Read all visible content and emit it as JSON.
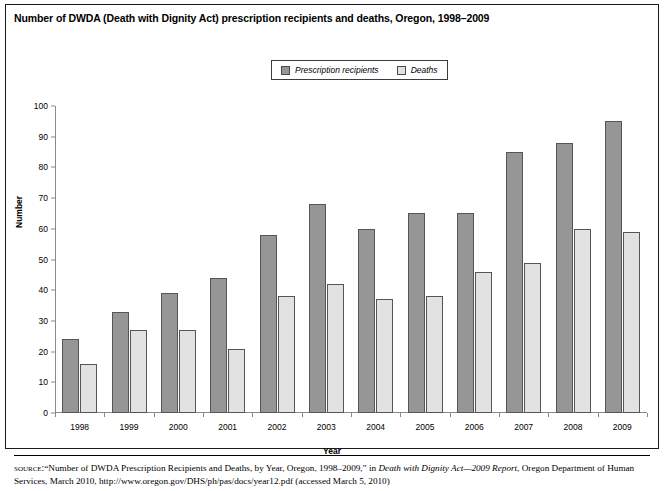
{
  "figure": {
    "title": "Number of DWDA (Death with Dignity Act) prescription recipients and deaths, Oregon, 1998–2009",
    "source_kicker": "source:",
    "source_text_1": "“Number of DWDA Prescription Recipients and Deaths, by Year, Oregon, 1998–2009,” in ",
    "source_italic": "Death with Dignity Act—2009 Report",
    "source_text_2": ", Oregon Department of Human Services, March 2010, http://www.oregon.gov/DHS/ph/pas/docs/year12.pdf (accessed March 5, 2010)"
  },
  "colors": {
    "recipients": "#969696",
    "deaths": "#e2e2e2",
    "bar_outline": "#555555",
    "axis": "#8a8a8a",
    "frame": "#1a1a1a"
  },
  "chart_data": {
    "type": "bar",
    "title": "Number of DWDA (Death with Dignity Act) prescription recipients and deaths, Oregon, 1998–2009",
    "xlabel": "Year",
    "ylabel": "Number",
    "ylim": [
      0,
      100
    ],
    "yticks": [
      0,
      10,
      20,
      30,
      40,
      50,
      60,
      70,
      80,
      90,
      100
    ],
    "grid": false,
    "legend_position": "top-center",
    "categories": [
      "1998",
      "1999",
      "2000",
      "2001",
      "2002",
      "2003",
      "2004",
      "2005",
      "2006",
      "2007",
      "2008",
      "2009"
    ],
    "series": [
      {
        "name": "Prescription recipients",
        "color": "#969696",
        "values": [
          24,
          33,
          39,
          44,
          58,
          68,
          60,
          65,
          65,
          85,
          88,
          95
        ]
      },
      {
        "name": "Deaths",
        "color": "#e2e2e2",
        "values": [
          16,
          27,
          27,
          21,
          38,
          42,
          37,
          38,
          46,
          49,
          60,
          59
        ]
      }
    ]
  }
}
